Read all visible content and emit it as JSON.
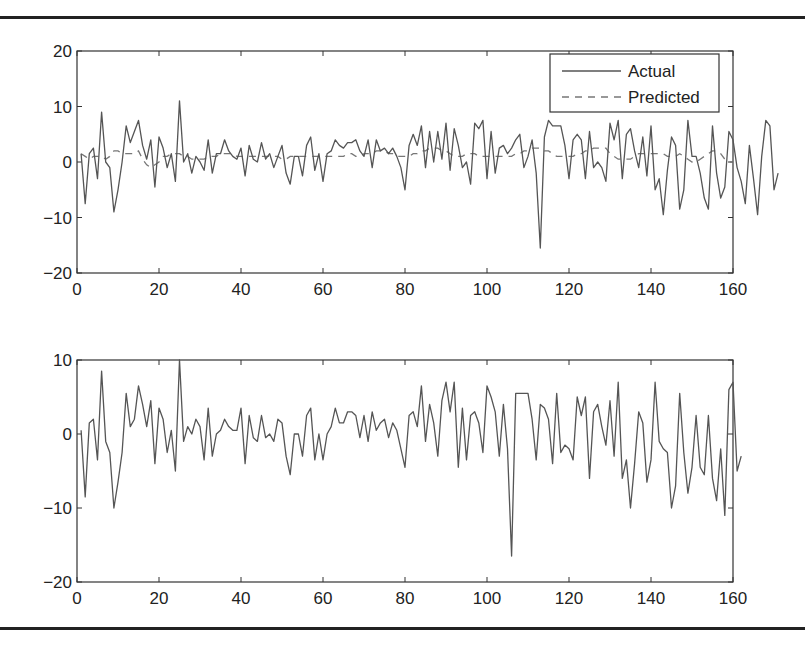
{
  "figure": {
    "top_panel": {
      "legend": {
        "actual_label": "Actual",
        "predicted_label": "Predicted"
      },
      "yticks": [
        "20",
        "10",
        "0",
        "-10",
        "-20"
      ],
      "xticks": [
        "0",
        "20",
        "40",
        "60",
        "80",
        "100",
        "120",
        "140",
        "160"
      ]
    },
    "bottom_panel": {
      "yticks": [
        "10",
        "0",
        "-10",
        "-20"
      ],
      "xticks": [
        "0",
        "20",
        "40",
        "60",
        "80",
        "100",
        "120",
        "140",
        "160"
      ]
    }
  },
  "colors": {
    "line": "#555555",
    "axis": "#333333",
    "rule": "#222222"
  },
  "chart_data": [
    {
      "type": "line",
      "title": "",
      "xlabel": "",
      "ylabel": "",
      "xlim": [
        0,
        160
      ],
      "ylim": [
        -20,
        20
      ],
      "xticks": [
        0,
        20,
        40,
        60,
        80,
        100,
        120,
        140,
        160
      ],
      "yticks": [
        -20,
        -10,
        0,
        10,
        20
      ],
      "grid": false,
      "legend_position": "top-right",
      "series": [
        {
          "name": "Actual",
          "style": "solid",
          "x_start": 1,
          "values": [
            1.5,
            -7.5,
            1.5,
            2.5,
            -3,
            9,
            0,
            -1,
            -9,
            -5,
            0,
            6.5,
            3.5,
            5.5,
            7.5,
            3,
            0.5,
            4,
            -4.5,
            4.5,
            2.5,
            -1,
            1.5,
            -3.5,
            11,
            0,
            1.5,
            -2,
            1,
            0,
            -1.5,
            4,
            -2,
            1.5,
            1.5,
            4,
            2,
            1,
            0.5,
            2.5,
            -2.5,
            3,
            0.5,
            0,
            3.5,
            0.5,
            1.5,
            -1,
            1,
            3,
            -2,
            -4,
            1,
            1,
            -2.5,
            3,
            4.5,
            -1.5,
            1.5,
            -3.5,
            1.5,
            2,
            4,
            3,
            2.5,
            3.5,
            3.5,
            4,
            2,
            1,
            4,
            -1,
            4,
            2,
            2.5,
            1.5,
            2.5,
            1,
            -1,
            -5,
            3,
            5,
            3,
            6.5,
            -1,
            5.5,
            0,
            5.5,
            0.5,
            7,
            -1.5,
            6,
            3,
            -1,
            0,
            -4,
            7,
            6,
            7.5,
            -3,
            5.5,
            -2,
            2.5,
            3,
            1.5,
            2.5,
            4,
            5,
            -1,
            1,
            4,
            -2,
            -15.5,
            4.5,
            7.5,
            6.5,
            6.5,
            6.5,
            3,
            -3,
            4,
            5,
            4,
            -3,
            5.5,
            -1,
            0,
            -1,
            -3.5,
            7,
            4,
            7.5,
            -3,
            5,
            6,
            2,
            -1,
            4.5,
            -2.5,
            6.5,
            -5,
            -3,
            -9.5,
            -1.5,
            4.5,
            3,
            -8.5,
            -5,
            7.5,
            1,
            1,
            -2,
            -6.5,
            -8.5,
            6.5,
            -2,
            -6.5,
            -4.5,
            5.5,
            4,
            -1,
            -3.5,
            -7.5,
            3,
            -3,
            -9.5,
            1,
            7.5,
            6.5,
            -5,
            -2
          ],
          "note": "approximate values read from plot, x = 1..158"
        },
        {
          "name": "Predicted",
          "style": "dashed",
          "x_start": 1,
          "values": [
            1.5,
            1,
            0.5,
            1,
            1,
            1,
            0.5,
            1,
            2,
            2,
            1.5,
            1.5,
            1.5,
            1.5,
            2,
            0.5,
            -0.5,
            -1,
            -0.5,
            0,
            1,
            1,
            1.5,
            1.5,
            1.5,
            1,
            1,
            0.5,
            0.5,
            0.5,
            0.5,
            1,
            1,
            1,
            1.5,
            1.5,
            1.5,
            1.5,
            1,
            1,
            1,
            1,
            1,
            1,
            1,
            1,
            1,
            1,
            1,
            0.5,
            0.5,
            1,
            1,
            1,
            1,
            1,
            1,
            1,
            1,
            1,
            1,
            1,
            1,
            1,
            1,
            1.5,
            1.5,
            1,
            1,
            1.5,
            1.5,
            1.5,
            2,
            2,
            2,
            1.5,
            1.5,
            1,
            1,
            1,
            1,
            1.5,
            1.5,
            2,
            2,
            2.5,
            2.5,
            2.5,
            2,
            2,
            1.5,
            1,
            1,
            1,
            1.5,
            1.5,
            1.5,
            1,
            1,
            1,
            1,
            1,
            1,
            1,
            1,
            1,
            1.5,
            1.5,
            2,
            2,
            2.5,
            2.5,
            2.5,
            2,
            2,
            1.5,
            1,
            1,
            1,
            1,
            1,
            1.5,
            1.5,
            2,
            2,
            2.5,
            2.5,
            2.5,
            2.5,
            1.5,
            1,
            0.5,
            0.5,
            0.5,
            0.5,
            1,
            1.5,
            1.5,
            1.5,
            1.5,
            1.5,
            1.5,
            1.5,
            1,
            1,
            1,
            1.5,
            1,
            0.5,
            0,
            0,
            0.5,
            1,
            1.5,
            2,
            2,
            1.5,
            0.5,
            0,
            0
          ],
          "note": "approximate values read from plot, x = 1..158"
        }
      ]
    },
    {
      "type": "line",
      "title": "",
      "xlabel": "",
      "ylabel": "",
      "xlim": [
        0,
        160
      ],
      "ylim": [
        -20,
        10
      ],
      "xticks": [
        0,
        20,
        40,
        60,
        80,
        100,
        120,
        140,
        160
      ],
      "yticks": [
        -20,
        -10,
        0,
        10
      ],
      "grid": false,
      "series": [
        {
          "name": "Residual",
          "style": "solid",
          "x_start": 1,
          "values": [
            0.5,
            -8.5,
            1.5,
            2,
            -3.5,
            8.5,
            -1,
            -2.5,
            -10,
            -6.5,
            -2.5,
            5.5,
            1,
            2,
            6.5,
            4,
            1,
            4.5,
            -4,
            3.5,
            2,
            -2.5,
            0.5,
            -5,
            10,
            -1,
            1,
            0,
            2,
            1,
            -3.5,
            3.5,
            -3,
            0,
            0.5,
            2,
            1,
            0.5,
            0.5,
            3.5,
            -4,
            2.5,
            -0.5,
            -1,
            2.5,
            -0.5,
            0,
            -1,
            2,
            1.5,
            -3,
            -5.5,
            0,
            0,
            -3,
            2.5,
            3.5,
            -3.5,
            0,
            -3.5,
            0,
            1,
            3.5,
            1.5,
            1.5,
            3,
            3,
            2.5,
            -0.5,
            2.5,
            -1,
            3,
            0.5,
            1.5,
            2,
            -0.5,
            1.5,
            0.5,
            -2,
            -4.5,
            2.5,
            3,
            1,
            6.5,
            -1,
            4,
            1.5,
            -3,
            4.5,
            7,
            3,
            7,
            -4.5,
            3.5,
            -3.5,
            2.5,
            3,
            1.5,
            -2.5,
            6.5,
            5,
            3,
            -3,
            4,
            -2,
            -16.5,
            5.5,
            5.5,
            5.5,
            5.5,
            2,
            -3.5,
            4,
            3.5,
            2,
            -4,
            5.5,
            -2.5,
            -1.5,
            -2,
            -3.5,
            5,
            2.5,
            5,
            -6,
            3,
            4,
            1,
            -1.5,
            4.5,
            -3,
            7,
            -6,
            -3.5,
            -10,
            -4,
            3,
            1.5,
            -6.5,
            -3.5,
            7,
            -1,
            -2,
            -2.5,
            -10,
            -7,
            5.5,
            -2.5,
            -8,
            -4.5,
            2.5,
            -4.5,
            -5.5,
            2.5,
            -6,
            -9,
            -2,
            -11,
            6,
            7,
            -5,
            -3
          ],
          "note": "approximate values read from plot, x = 1..158"
        }
      ]
    }
  ]
}
